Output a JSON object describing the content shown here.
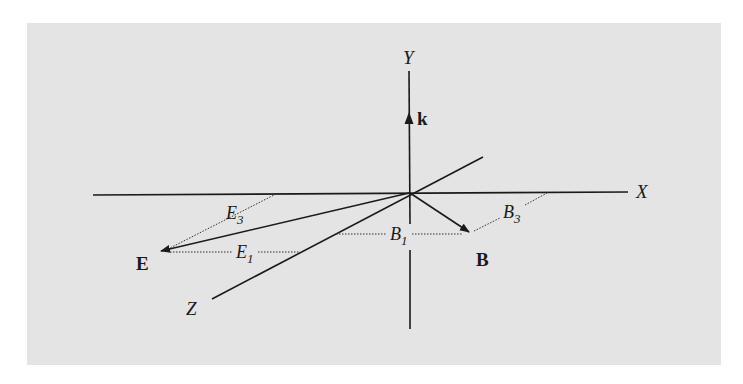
{
  "figure": {
    "background_color": "#e4e4e4",
    "line_color": "#1a1a1a",
    "axes": {
      "x": {
        "label": "X"
      },
      "y": {
        "label": "Y"
      },
      "z": {
        "label": "Z"
      }
    },
    "vectors": {
      "k": {
        "label": "k"
      },
      "E": {
        "label": "E"
      },
      "B": {
        "label": "B"
      }
    },
    "components": {
      "E1": {
        "base": "E",
        "sub": "1"
      },
      "E3": {
        "base": "E",
        "sub": "3"
      },
      "B1": {
        "base": "B",
        "sub": "1"
      },
      "B3": {
        "base": "B",
        "sub": "3"
      }
    }
  }
}
